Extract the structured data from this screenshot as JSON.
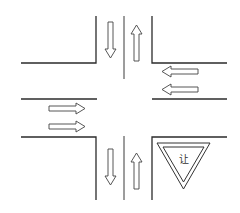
{
  "diagram": {
    "type": "road-intersection",
    "sign": {
      "shape": "inverted-triangle",
      "text": "让",
      "meaning": "yield"
    },
    "lanes": {
      "north_approach": {
        "arrows": [
          "down",
          "up"
        ]
      },
      "east_approach": {
        "arrows": [
          "left",
          "left"
        ]
      },
      "west_approach": {
        "arrows": [
          "right",
          "right"
        ]
      },
      "south_approach": {
        "arrows": [
          "down",
          "up"
        ]
      }
    },
    "colors": {
      "line": "#2b2b2b",
      "background": "#ffffff"
    }
  }
}
